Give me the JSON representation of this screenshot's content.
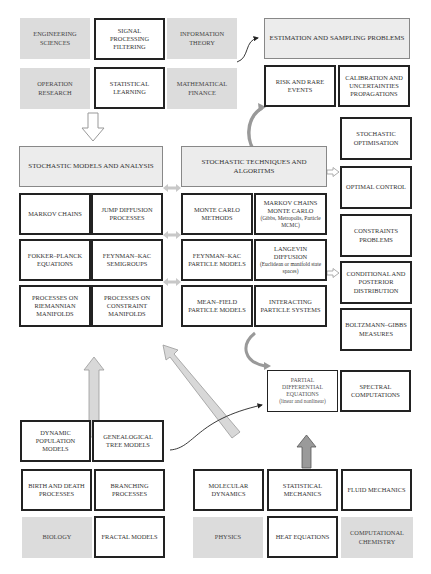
{
  "diagram": {
    "top_fields": {
      "engineering": "ENGINEERING SCIENCES",
      "signal": "SIGNAL PROCESSING FILTERING",
      "information": "INFORMATION THEORY",
      "operation": "OPERATION RESEARCH",
      "statistical_learning": "STATISTICAL LEARNING",
      "math_finance": "MATHEMATICAL FINANCE"
    },
    "estimation": {
      "header": "ESTIMATION AND SAMPLING PROBLEMS",
      "risk": "RISK AND RARE EVENTS",
      "calibration": "CALIBRATION AND UNCERTAINTIES PROPAGATIONS"
    },
    "models": {
      "header": "STOCHASTIC MODELS AND ANALYSIS",
      "markov": "MARKOV CHAINS",
      "jump": "JUMP DIFFUSION PROCESSES",
      "fokker": "FOKKER–PLANCK EQUATIONS",
      "feynman_semigroups": "FEYNMAN–KAC SEMIGROUPS",
      "riemannian": "PROCESSES ON RIEMANNIAN MANIFOLDS",
      "constraint": "PROCESSES ON CONSTRAINT MANIFOLDS"
    },
    "techniques": {
      "header": "STOCHASTIC TECHNIQUES AND ALGORITMS",
      "monte_carlo": "MONTE CARLO METHODS",
      "mcmc_title": "MARKOV CHAINS MONTE CARLO",
      "mcmc_sub": "(Gibbs, Metropolis, Particle MCMC)",
      "feynman_particle": "FEYNMAN–KAC PARTICLE MODELS",
      "langevin_title": "LANGEVIN DIFFUSION",
      "langevin_sub": "(Euclidean or manifold state spaces)",
      "mean_field": "MEAN–FIELD PARTICLE MODELS",
      "interacting": "INTERACTING PARTICLE SYSTEMS"
    },
    "applications": {
      "optimisation": "STOCHASTIC OPTIMISATION",
      "optimal_control": "OPTIMAL CONTROL",
      "constraints": "CONSTRAINTS PROBLEMS",
      "conditional": "CONDITIONAL AND POSTERIOR DISTRIBUTION",
      "boltzmann": "BOLTZMANN–GIBBS MEASURES"
    },
    "pde": {
      "title": "PARTIAL DIFFERENTIAL EQUATIONS",
      "sub": "(linear and nonlinear)",
      "spectral": "SPECTRAL COMPUTATIONS"
    },
    "biology": {
      "dynamic_population": "DYNAMIC POPULATION MODELS",
      "genealogical": "GENEALOGICAL TREE MODELS",
      "birth_death": "BIRTH AND DEATH PROCESSES",
      "branching": "BRANCHING PROCESSES",
      "biology": "BIOLOGY",
      "fractal": "FRACTAL MODELS"
    },
    "physics": {
      "molecular": "MOLECULAR DYNAMICS",
      "statistical_mechanics": "STATISTICAL MECHANICS",
      "fluid": "FLUID MECHANICS",
      "physics": "PHYSICS",
      "heat": "HEAT EQUATIONS",
      "chemistry": "COMPUTATIONAL CHEMISTRY"
    }
  },
  "colors": {
    "field_fill": "#dcdcdc",
    "header_fill": "#ececec",
    "border": "#222222",
    "arrow_fill": "#d8d8d8",
    "arrow_dark": "#9a9a9a"
  }
}
